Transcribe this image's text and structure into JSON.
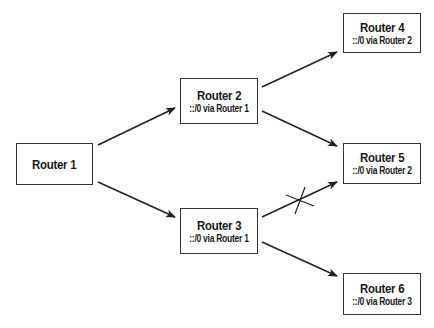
{
  "diagram": {
    "nodes": [
      {
        "id": "router-1",
        "title": "Router 1",
        "route": ""
      },
      {
        "id": "router-2",
        "title": "Router 2",
        "route": "::/0 via Router 1"
      },
      {
        "id": "router-3",
        "title": "Router 3",
        "route": "::/0 via Router 1"
      },
      {
        "id": "router-4",
        "title": "Router 4",
        "route": "::/0 via Router 2"
      },
      {
        "id": "router-5",
        "title": "Router 5",
        "route": "::/0 via Router 2"
      },
      {
        "id": "router-6",
        "title": "Router 6",
        "route": "::/0 via Router 3"
      }
    ],
    "edges": [
      {
        "from": "router-1",
        "to": "router-2",
        "blocked": false
      },
      {
        "from": "router-1",
        "to": "router-3",
        "blocked": false
      },
      {
        "from": "router-2",
        "to": "router-4",
        "blocked": false
      },
      {
        "from": "router-2",
        "to": "router-5",
        "blocked": false
      },
      {
        "from": "router-3",
        "to": "router-5",
        "blocked": true
      },
      {
        "from": "router-3",
        "to": "router-6",
        "blocked": false
      }
    ],
    "colors": {
      "line": "#222222",
      "border": "#333333",
      "background": "#ffffff"
    }
  }
}
